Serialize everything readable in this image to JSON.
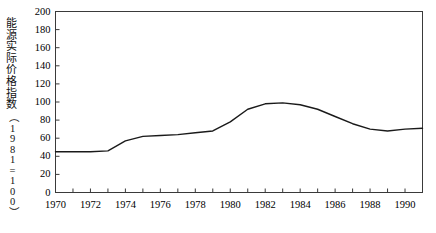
{
  "figure": {
    "axis_label_cjk": "能源实际价格指数",
    "axis_label_chars": [
      "能",
      "源",
      "实",
      "际",
      "价",
      "格",
      "指",
      "数"
    ],
    "axis_label_unit": "（1981=100）",
    "caption": ""
  },
  "chart_data": {
    "type": "line",
    "title": "",
    "xlabel": "",
    "ylabel": "能源实际价格指数（1981=100）",
    "xlim": [
      1970,
      1991
    ],
    "ylim": [
      0,
      200
    ],
    "ytick_step": 20,
    "xtick_step": 1,
    "grid": false,
    "legend": null,
    "line_color": "#1a1a1a",
    "yticks": [
      0,
      20,
      40,
      60,
      80,
      100,
      120,
      140,
      160,
      180,
      200
    ],
    "xticks": [
      1970,
      1971,
      1972,
      1973,
      1974,
      1975,
      1976,
      1977,
      1978,
      1979,
      1980,
      1981,
      1982,
      1983,
      1984,
      1985,
      1986,
      1987,
      1988,
      1989,
      1990,
      1991
    ],
    "xtick_labels_shown": [
      1970,
      1972,
      1974,
      1976,
      1978,
      1980,
      1982,
      1984,
      1986,
      1988,
      1990
    ],
    "x": [
      1970,
      1971,
      1972,
      1973,
      1974,
      1975,
      1976,
      1977,
      1978,
      1979,
      1980,
      1981,
      1982,
      1983,
      1984,
      1985,
      1986,
      1987,
      1988,
      1989,
      1990,
      1991
    ],
    "values": [
      45,
      45,
      45,
      46,
      57,
      62,
      63,
      64,
      66,
      68,
      78,
      92,
      98,
      99,
      97,
      92,
      84,
      76,
      70,
      68,
      70,
      71
    ],
    "series": [
      {
        "name": "能源实际价格指数",
        "values": [
          45,
          45,
          45,
          46,
          57,
          62,
          63,
          64,
          66,
          68,
          78,
          92,
          98,
          99,
          97,
          92,
          84,
          76,
          70,
          68,
          70,
          71
        ]
      }
    ]
  }
}
